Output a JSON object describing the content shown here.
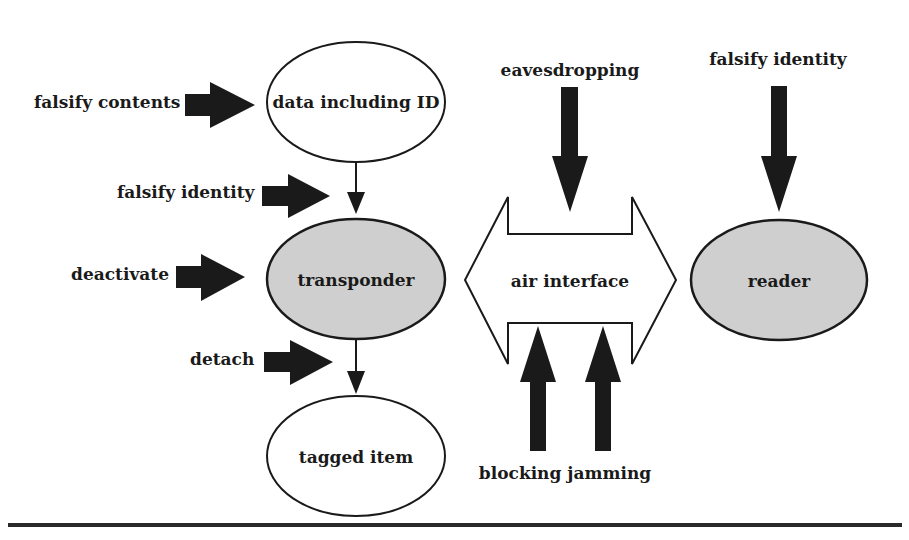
{
  "diagram": {
    "type": "rfid-attack-diagram",
    "colors": {
      "stroke": "#1a1a1a",
      "arrow_fill": "#1a1a1a",
      "shaded_node_fill": "#cfcfcf",
      "plain_node_fill": "#ffffff",
      "background": "#ffffff"
    },
    "nodes": {
      "data": {
        "label": "data including ID",
        "shaded": false
      },
      "transponder": {
        "label": "transponder",
        "shaded": true
      },
      "tagged_item": {
        "label": "tagged item",
        "shaded": false
      },
      "air_interface": {
        "label": "air interface",
        "shape": "double-arrow"
      },
      "reader": {
        "label": "reader",
        "shaded": true
      }
    },
    "attacks": {
      "falsify_contents": {
        "label": "falsify contents",
        "target": "data including ID"
      },
      "falsify_identity_tag": {
        "label": "falsify identity",
        "target": "transponder"
      },
      "deactivate": {
        "label": "deactivate",
        "target": "transponder"
      },
      "detach": {
        "label": "detach",
        "target": "tagged item"
      },
      "eavesdropping": {
        "label": "eavesdropping",
        "target": "air interface"
      },
      "falsify_identity_reader": {
        "label": "falsify identity",
        "target": "reader"
      },
      "blocking_jamming": {
        "label": "blocking jamming",
        "target": "air interface"
      }
    },
    "edges": [
      {
        "from": "data including ID",
        "to": "transponder"
      },
      {
        "from": "transponder",
        "to": "tagged item"
      }
    ]
  }
}
